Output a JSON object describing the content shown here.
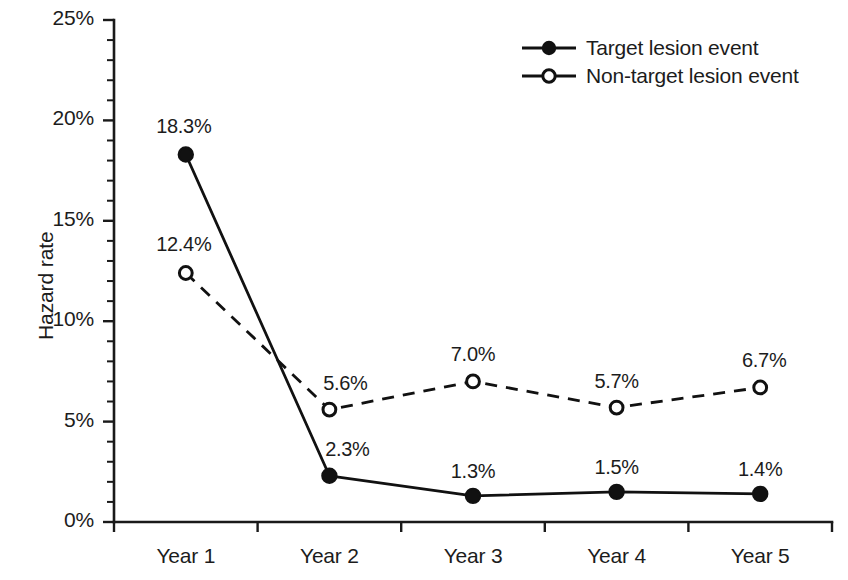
{
  "chart_data": {
    "type": "line",
    "title": "",
    "xlabel": "",
    "ylabel": "Hazard rate",
    "categories": [
      "Year 1",
      "Year 2",
      "Year 3",
      "Year 4",
      "Year 5"
    ],
    "ylim": [
      0,
      25
    ],
    "ytick_step": 5,
    "yminor_step": 1,
    "ytick_labels": [
      "0%",
      "5%",
      "10%",
      "15%",
      "20%",
      "25%"
    ],
    "ytick_values": [
      0,
      5,
      10,
      15,
      20,
      25
    ],
    "grid": false,
    "legend_position": "top-right",
    "series": [
      {
        "name": "Target lesion event",
        "marker": "filled-circle",
        "linestyle": "solid",
        "values": [
          18.3,
          2.3,
          1.3,
          1.5,
          1.4
        ],
        "point_labels": [
          "18.3%",
          "2.3%",
          "1.3%",
          "1.5%",
          "1.4%"
        ]
      },
      {
        "name": "Non-target lesion event",
        "marker": "open-circle",
        "linestyle": "dashed",
        "values": [
          12.4,
          5.6,
          7.0,
          5.7,
          6.7
        ],
        "point_labels": [
          "12.4%",
          "5.6%",
          "7.0%",
          "5.7%",
          "6.7%"
        ]
      }
    ]
  },
  "colors": {
    "line": "#111111",
    "axis": "#1a1a1a",
    "text": "#1c1c1c",
    "background": "#ffffff"
  },
  "legend": {
    "items": [
      {
        "label": "Target lesion event"
      },
      {
        "label": "Non-target lesion event"
      }
    ]
  },
  "axis": {
    "y_title": "Hazard rate"
  }
}
